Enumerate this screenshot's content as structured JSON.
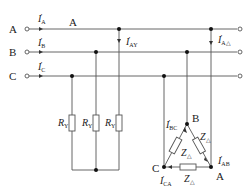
{
  "diagram": {
    "title": "",
    "line_labels": {
      "A": "A",
      "B": "B",
      "C": "C"
    },
    "top_label": "A",
    "currents": {
      "IA": {
        "sym": "I",
        "sub": "A"
      },
      "IB": {
        "sym": "I",
        "sub": "B"
      },
      "IC": {
        "sym": "I",
        "sub": "C"
      },
      "IAY": {
        "sym": "I",
        "sub": "AY"
      },
      "IAD": {
        "sym": "I",
        "sub": "A△"
      },
      "IBC": {
        "sym": "I",
        "sub": "BC"
      },
      "IAB": {
        "sym": "I",
        "sub": "AB"
      },
      "ICA": {
        "sym": "I",
        "sub": "CA"
      }
    },
    "resistors": [
      {
        "sym": "R",
        "sub": "Y"
      },
      {
        "sym": "R",
        "sub": "Y"
      },
      {
        "sym": "R",
        "sub": "Y"
      }
    ],
    "impedances": [
      {
        "sym": "Z",
        "sub": "△"
      },
      {
        "sym": "Z",
        "sub": "△"
      },
      {
        "sym": "Z",
        "sub": "△"
      }
    ],
    "delta_nodes": {
      "A": "A",
      "B": "B",
      "C": "C"
    },
    "colors": {
      "wire": "#555555",
      "text": "#222222"
    }
  }
}
